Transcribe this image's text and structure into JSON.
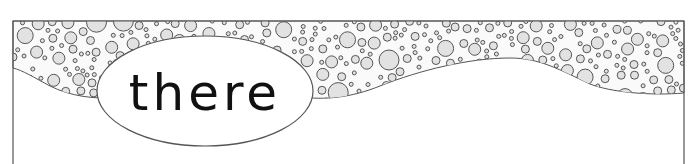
{
  "card": {
    "word": "there",
    "decoration": "bubble-band-border"
  },
  "colors": {
    "border": "#555555",
    "bubble_fill": "#e2e2e2",
    "bubble_stroke": "#555555",
    "background": "#ffffff",
    "text": "#111111"
  }
}
